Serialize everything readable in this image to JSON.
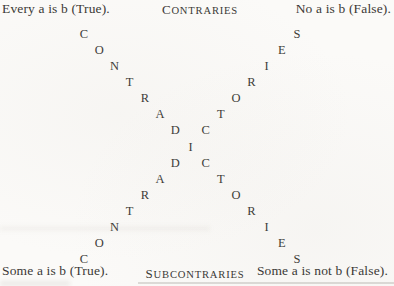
{
  "page": {
    "background": "#fbfaf8",
    "ink": "#3b3936"
  },
  "corners": {
    "top_left": "Every a is b (True).",
    "top_right": "No a is b (False).",
    "bottom_left": "Some a is b (True).",
    "bottom_right": "Some a is not b (False)."
  },
  "relations": {
    "top": {
      "initial": "C",
      "rest": "ONTRARIES"
    },
    "bottom": {
      "initial": "S",
      "rest": "UBCONTRARIES"
    },
    "diagonal_word": "CONTRADICTORIES",
    "shared_center_index": 7
  }
}
